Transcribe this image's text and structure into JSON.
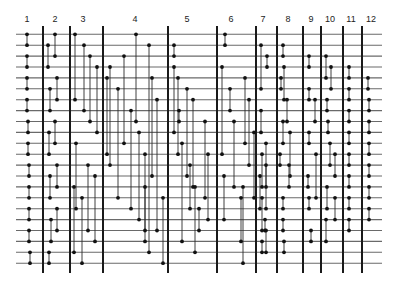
{
  "diagram": {
    "type": "sorting-network",
    "wire_count": 22,
    "wire_top_y": 34.3,
    "wire_spacing": 10.9,
    "wire_x_start": 16,
    "wire_x_end": 382,
    "separator_top": 26,
    "separator_bottom": 273,
    "colors": {
      "wire": "#6a6a6a",
      "separator": "#1a1a1a",
      "comparator": "#2a2a2a",
      "dot": "#111111"
    },
    "stages": [
      {
        "label": "1",
        "x": 27
      },
      {
        "label": "2",
        "x": 55
      },
      {
        "label": "3",
        "x": 83
      },
      {
        "label": "4",
        "x": 135
      },
      {
        "label": "5",
        "x": 187
      },
      {
        "label": "6",
        "x": 231
      },
      {
        "label": "7",
        "x": 263
      },
      {
        "label": "8",
        "x": 288
      },
      {
        "label": "9",
        "x": 311
      },
      {
        "label": "10",
        "x": 330
      },
      {
        "label": "11",
        "x": 351
      },
      {
        "label": "12",
        "x": 371
      }
    ],
    "separators": [
      43,
      70,
      103,
      168,
      217,
      256,
      277,
      303,
      321,
      343,
      362
    ],
    "comparators": [
      [
        27,
        0,
        1
      ],
      [
        27,
        2,
        3
      ],
      [
        27,
        4,
        5
      ],
      [
        27,
        6,
        7
      ],
      [
        28,
        8,
        9
      ],
      [
        28,
        10,
        11
      ],
      [
        29,
        12,
        13
      ],
      [
        29,
        14,
        15
      ],
      [
        29,
        16,
        17
      ],
      [
        29,
        18,
        19
      ],
      [
        30,
        20,
        21
      ],
      [
        48,
        1,
        3
      ],
      [
        55,
        0,
        2
      ],
      [
        50,
        5,
        7
      ],
      [
        57,
        4,
        6
      ],
      [
        49,
        9,
        11
      ],
      [
        55,
        8,
        10
      ],
      [
        50,
        13,
        15
      ],
      [
        57,
        12,
        14
      ],
      [
        51,
        17,
        19
      ],
      [
        57,
        16,
        18
      ],
      [
        49,
        20,
        21
      ],
      [
        75,
        0,
        6
      ],
      [
        84,
        1,
        7
      ],
      [
        90,
        2,
        8
      ],
      [
        97,
        3,
        9
      ],
      [
        107,
        4,
        11
      ],
      [
        76,
        10,
        16
      ],
      [
        88,
        12,
        18
      ],
      [
        95,
        13,
        19
      ],
      [
        74,
        14,
        20
      ],
      [
        82,
        15,
        21
      ],
      [
        110,
        3,
        12
      ],
      [
        118,
        5,
        15
      ],
      [
        124,
        2,
        10
      ],
      [
        131,
        7,
        16
      ],
      [
        136,
        0,
        8
      ],
      [
        139,
        9,
        17
      ],
      [
        145,
        11,
        19
      ],
      [
        149,
        1,
        20
      ],
      [
        152,
        4,
        13
      ],
      [
        157,
        6,
        18
      ],
      [
        145,
        14,
        18
      ],
      [
        163,
        15,
        21
      ],
      [
        174,
        1,
        2
      ],
      [
        174,
        3,
        9
      ],
      [
        178,
        4,
        11
      ],
      [
        179,
        7,
        8
      ],
      [
        182,
        10,
        19
      ],
      [
        187,
        5,
        13
      ],
      [
        190,
        12,
        16
      ],
      [
        193,
        6,
        14
      ],
      [
        195,
        14,
        20
      ],
      [
        199,
        16,
        18
      ],
      [
        205,
        8,
        15
      ],
      [
        208,
        11,
        17
      ],
      [
        225,
        0,
        1
      ],
      [
        222,
        3,
        11
      ],
      [
        230,
        5,
        7
      ],
      [
        245,
        4,
        10
      ],
      [
        249,
        6,
        12
      ],
      [
        234,
        8,
        14
      ],
      [
        254,
        9,
        15
      ],
      [
        224,
        13,
        17
      ],
      [
        243,
        14,
        21
      ],
      [
        241,
        15,
        19
      ],
      [
        260,
        13,
        16
      ],
      [
        261,
        1,
        5
      ],
      [
        267,
        2,
        3
      ],
      [
        261,
        7,
        9
      ],
      [
        266,
        10,
        16
      ],
      [
        262,
        11,
        14
      ],
      [
        266,
        12,
        14
      ],
      [
        262,
        15,
        18
      ],
      [
        265,
        17,
        18
      ],
      [
        266,
        18,
        20
      ],
      [
        262,
        19,
        20
      ],
      [
        283,
        1,
        2
      ],
      [
        284,
        3,
        6
      ],
      [
        281,
        4,
        5
      ],
      [
        287,
        6,
        8
      ],
      [
        283,
        8,
        10
      ],
      [
        290,
        9,
        13
      ],
      [
        280,
        11,
        12
      ],
      [
        289,
        12,
        14
      ],
      [
        283,
        15,
        16
      ],
      [
        283,
        17,
        18
      ],
      [
        284,
        19,
        20
      ],
      [
        309,
        2,
        3
      ],
      [
        309,
        5,
        6
      ],
      [
        315,
        6,
        8
      ],
      [
        309,
        9,
        10
      ],
      [
        316,
        11,
        15
      ],
      [
        308,
        13,
        14
      ],
      [
        309,
        15,
        16
      ],
      [
        311,
        18,
        19
      ],
      [
        326,
        2,
        4
      ],
      [
        331,
        3,
        5
      ],
      [
        327,
        6,
        7
      ],
      [
        328,
        8,
        9
      ],
      [
        330,
        10,
        12
      ],
      [
        335,
        11,
        13
      ],
      [
        327,
        14,
        16
      ],
      [
        335,
        15,
        17
      ],
      [
        326,
        17,
        19
      ],
      [
        349,
        3,
        4
      ],
      [
        349,
        5,
        6
      ],
      [
        349,
        7,
        8
      ],
      [
        349,
        9,
        10
      ],
      [
        349,
        11,
        12
      ],
      [
        349,
        13,
        14
      ],
      [
        349,
        15,
        16
      ],
      [
        349,
        17,
        18
      ],
      [
        368,
        4,
        5
      ],
      [
        369,
        6,
        7
      ],
      [
        369,
        8,
        9
      ],
      [
        369,
        10,
        11
      ],
      [
        369,
        12,
        13
      ],
      [
        369,
        14,
        15
      ],
      [
        369,
        16,
        17
      ]
    ]
  }
}
